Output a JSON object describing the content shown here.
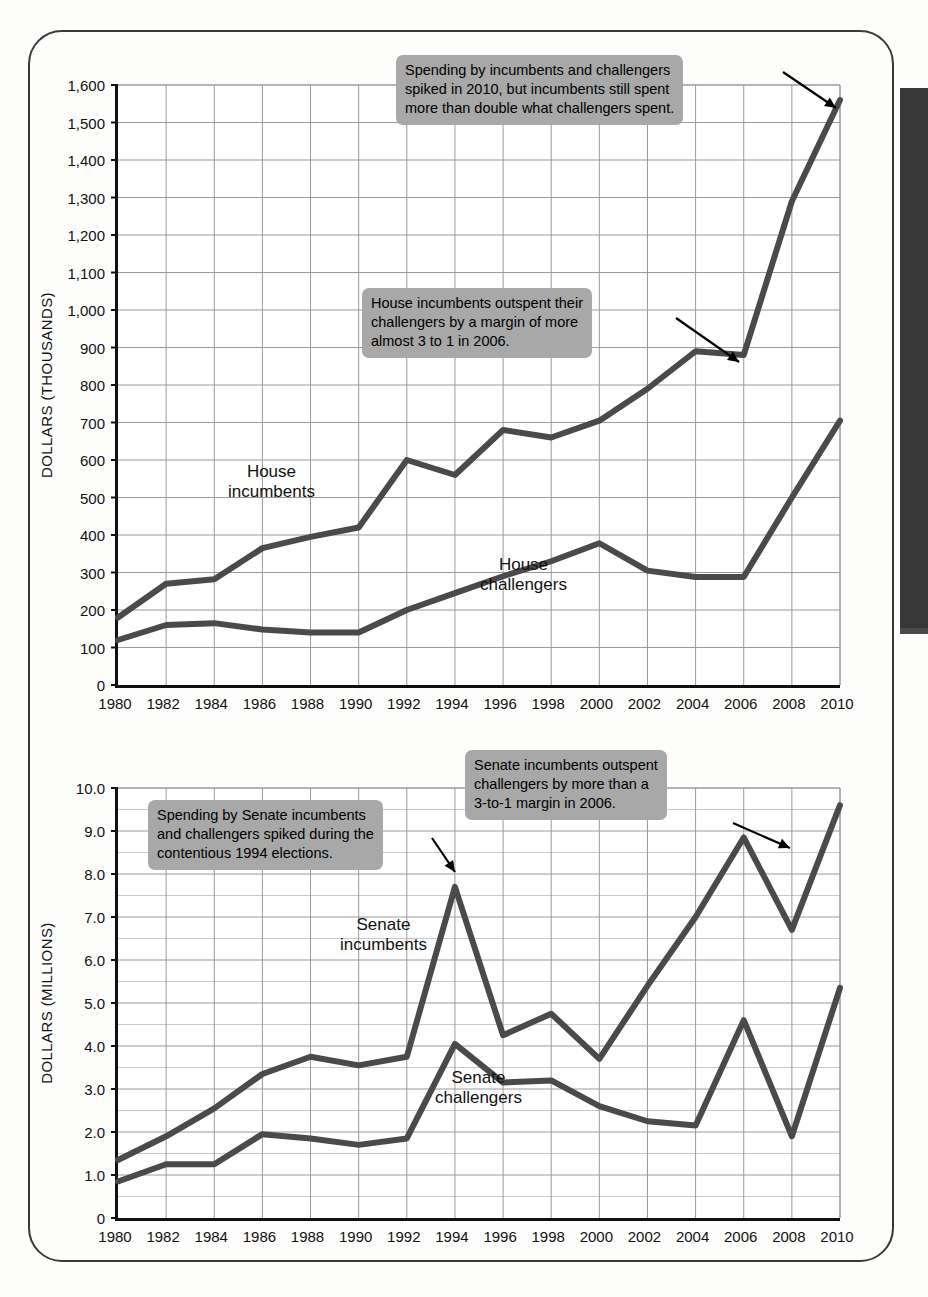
{
  "page": {
    "edge_tab_color": "#383838",
    "frame_color": "#3a3a3a"
  },
  "charts": [
    {
      "id": "house",
      "ylabel": "DOLLARS (THOUSANDS)",
      "series_labels": [
        {
          "text_line1": "House",
          "text_line2": "incumbents"
        },
        {
          "text_line1": "House",
          "text_line2": "challengers"
        }
      ],
      "annotations": [
        {
          "lines": [
            "Spending by incumbents and challengers",
            "spiked in 2010, but incumbents still spent",
            "more than double what challengers spent."
          ]
        },
        {
          "lines": [
            "House incumbents outspent their",
            "challengers by a margin of more",
            "almost 3 to 1 in 2006."
          ]
        }
      ]
    },
    {
      "id": "senate",
      "ylabel": "DOLLARS (MILLIONS)",
      "series_labels": [
        {
          "text_line1": "Senate",
          "text_line2": "incumbents"
        },
        {
          "text_line1": "Senate",
          "text_line2": "challengers"
        }
      ],
      "annotations": [
        {
          "lines": [
            "Senate incumbents outspent",
            "challengers by more than a",
            "3-to-1 margin in 2006."
          ]
        },
        {
          "lines": [
            "Spending by Senate incumbents",
            "and challengers spiked during the",
            "contentious 1994 elections."
          ]
        }
      ]
    }
  ],
  "chart_data": [
    {
      "type": "line",
      "title": "",
      "xlabel": "",
      "ylabel": "DOLLARS (THOUSANDS)",
      "categories": [
        1980,
        1982,
        1984,
        1986,
        1988,
        1990,
        1992,
        1994,
        1996,
        1998,
        2000,
        2002,
        2004,
        2006,
        2008,
        2010
      ],
      "x": [
        "1980",
        "1982",
        "1984",
        "1986",
        "1988",
        "1990",
        "1992",
        "1994",
        "1996",
        "1998",
        "2000",
        "2002",
        "2004",
        "2006",
        "2008",
        "2010"
      ],
      "xlim": [
        1980,
        2010
      ],
      "ylim": [
        0,
        1600
      ],
      "yticks": [
        0,
        100,
        200,
        300,
        400,
        500,
        600,
        700,
        800,
        900,
        1000,
        1100,
        1200,
        1300,
        1400,
        1500,
        1600
      ],
      "ytick_labels": [
        "0",
        "100",
        "200",
        "300",
        "400",
        "500",
        "600",
        "700",
        "800",
        "900",
        "1,000",
        "1,100",
        "1,200",
        "1,300",
        "1,400",
        "1,500",
        "1,600"
      ],
      "grid": true,
      "legend": "inline-labels",
      "series": [
        {
          "name": "House incumbents",
          "values": [
            180,
            270,
            282,
            365,
            395,
            420,
            600,
            560,
            680,
            660,
            705,
            790,
            890,
            880,
            1290,
            1560
          ],
          "color": "#4a4a4a"
        },
        {
          "name": "House challengers",
          "values": [
            120,
            160,
            165,
            148,
            140,
            140,
            200,
            245,
            290,
            330,
            378,
            305,
            288,
            288,
            500,
            705
          ],
          "color": "#4a4a4a"
        }
      ]
    },
    {
      "type": "line",
      "title": "",
      "xlabel": "",
      "ylabel": "DOLLARS (MILLIONS)",
      "categories": [
        1980,
        1982,
        1984,
        1986,
        1988,
        1990,
        1992,
        1994,
        1996,
        1998,
        2000,
        2002,
        2004,
        2006,
        2008,
        2010
      ],
      "x": [
        "1980",
        "1982",
        "1984",
        "1986",
        "1988",
        "1990",
        "1992",
        "1994",
        "1996",
        "1998",
        "2000",
        "2002",
        "2004",
        "2006",
        "2008",
        "2010"
      ],
      "xlim": [
        1980,
        2010
      ],
      "ylim": [
        0,
        10
      ],
      "yticks": [
        0,
        1,
        2,
        3,
        4,
        5,
        6,
        7,
        8,
        9,
        10
      ],
      "ytick_labels": [
        "0",
        "1.0",
        "2.0",
        "3.0",
        "4.0",
        "5.0",
        "6.0",
        "7.0",
        "8.0",
        "9.0",
        "10.0"
      ],
      "minor_ytick_step": 0.5,
      "grid": true,
      "legend": "inline-labels",
      "series": [
        {
          "name": "Senate incumbents",
          "values": [
            1.35,
            1.9,
            2.55,
            3.35,
            3.75,
            3.55,
            3.75,
            7.7,
            4.25,
            4.75,
            3.7,
            5.4,
            7.0,
            8.85,
            6.7,
            9.6
          ],
          "color": "#4a4a4a"
        },
        {
          "name": "Senate challengers",
          "values": [
            0.85,
            1.25,
            1.25,
            1.95,
            1.85,
            1.7,
            1.85,
            4.05,
            3.15,
            3.2,
            2.6,
            2.25,
            2.15,
            4.6,
            1.9,
            5.35
          ],
          "color": "#4a4a4a"
        }
      ]
    }
  ]
}
